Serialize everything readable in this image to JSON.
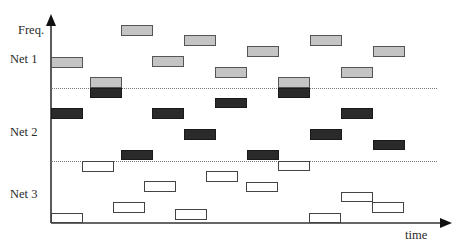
{
  "diagram": {
    "y_axis_label": "Freq.",
    "x_axis_label": "time",
    "net_labels": [
      {
        "label": "Net 1",
        "x": 10,
        "y": 53
      },
      {
        "label": "Net 2",
        "x": 10,
        "y": 125
      },
      {
        "label": "Net 3",
        "x": 10,
        "y": 187
      }
    ],
    "axes": {
      "origin": [
        51,
        223
      ],
      "y_top": 14,
      "x_right": 452,
      "color": "#333333"
    },
    "separators": [
      {
        "y": 88,
        "x1": 51,
        "x2": 437
      },
      {
        "y": 161,
        "x1": 51,
        "x2": 437
      }
    ],
    "colors": {
      "net1_fill": "#c4c4c4",
      "net2_fill": "#2a2a2a",
      "net3_fill": "#ffffff",
      "border": "#555555"
    },
    "blocks": {
      "net1": [
        {
          "x": 51,
          "y": 57,
          "w": 32,
          "h": 11
        },
        {
          "x": 90,
          "y": 77,
          "w": 32,
          "h": 11
        },
        {
          "x": 121,
          "y": 25,
          "w": 32,
          "h": 11
        },
        {
          "x": 152,
          "y": 56,
          "w": 32,
          "h": 11
        },
        {
          "x": 184,
          "y": 35,
          "w": 32,
          "h": 11
        },
        {
          "x": 215,
          "y": 67,
          "w": 32,
          "h": 11
        },
        {
          "x": 247,
          "y": 46,
          "w": 32,
          "h": 11
        },
        {
          "x": 278,
          "y": 77,
          "w": 32,
          "h": 11
        },
        {
          "x": 310,
          "y": 35,
          "w": 32,
          "h": 11
        },
        {
          "x": 341,
          "y": 67,
          "w": 32,
          "h": 11
        },
        {
          "x": 373,
          "y": 46,
          "w": 32,
          "h": 11
        }
      ],
      "net2": [
        {
          "x": 51,
          "y": 108,
          "w": 32,
          "h": 11
        },
        {
          "x": 90,
          "y": 88,
          "w": 32,
          "h": 10
        },
        {
          "x": 121,
          "y": 150,
          "w": 32,
          "h": 10
        },
        {
          "x": 152,
          "y": 108,
          "w": 32,
          "h": 11
        },
        {
          "x": 184,
          "y": 129,
          "w": 32,
          "h": 11
        },
        {
          "x": 215,
          "y": 98,
          "w": 32,
          "h": 10
        },
        {
          "x": 247,
          "y": 150,
          "w": 32,
          "h": 10
        },
        {
          "x": 278,
          "y": 88,
          "w": 32,
          "h": 10
        },
        {
          "x": 310,
          "y": 129,
          "w": 32,
          "h": 11
        },
        {
          "x": 341,
          "y": 108,
          "w": 32,
          "h": 11
        },
        {
          "x": 373,
          "y": 140,
          "w": 32,
          "h": 10
        }
      ],
      "net3": [
        {
          "x": 51,
          "y": 213,
          "w": 32,
          "h": 10
        },
        {
          "x": 82,
          "y": 161,
          "w": 32,
          "h": 11
        },
        {
          "x": 113,
          "y": 202,
          "w": 32,
          "h": 11
        },
        {
          "x": 144,
          "y": 181,
          "w": 32,
          "h": 11
        },
        {
          "x": 175,
          "y": 209,
          "w": 32,
          "h": 11
        },
        {
          "x": 206,
          "y": 171,
          "w": 32,
          "h": 11
        },
        {
          "x": 246,
          "y": 182,
          "w": 32,
          "h": 10
        },
        {
          "x": 278,
          "y": 161,
          "w": 32,
          "h": 10
        },
        {
          "x": 309,
          "y": 213,
          "w": 32,
          "h": 10
        },
        {
          "x": 341,
          "y": 192,
          "w": 32,
          "h": 10
        },
        {
          "x": 372,
          "y": 202,
          "w": 32,
          "h": 11
        }
      ]
    }
  }
}
